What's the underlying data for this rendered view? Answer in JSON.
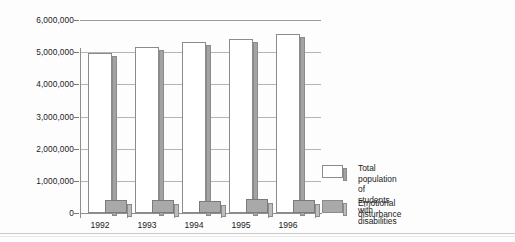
{
  "chart_data": {
    "type": "bar",
    "title": "",
    "subtitle": "",
    "xlabel": "",
    "ylabel": "",
    "grid": true,
    "legend_position": "right",
    "categories": [
      "1992",
      "1993",
      "1994",
      "1995",
      "1996"
    ],
    "ylim": [
      0,
      6000000
    ],
    "yticks": [
      0,
      1000000,
      2000000,
      3000000,
      4000000,
      5000000,
      6000000
    ],
    "ytick_labels": [
      "0",
      "1,000,000",
      "2,000,000",
      "3,000,000",
      "4,000,000",
      "5,000,000",
      "6,000,000"
    ],
    "series": [
      {
        "name": "Total population of students with disabilities",
        "legend_label": "Total population of\nstudents with disabilities",
        "color": "#ffffff",
        "values": [
          4980000,
          5150000,
          5320000,
          5410000,
          5570000
        ]
      },
      {
        "name": "Emotional disturbance",
        "legend_label": "Emotional disturbance",
        "color": "#a9a9a9",
        "values": [
          400000,
          390000,
          385000,
          425000,
          420000
        ]
      }
    ]
  },
  "colors": {
    "total_fill": "#ffffff",
    "total_side": "#a3a3a3",
    "ed_fill": "#a9a9a9",
    "ed_side": "#bdbdbd",
    "gridline": "#9a9a9a",
    "axis": "#8e8e8e",
    "text": "#1a1a1a"
  }
}
